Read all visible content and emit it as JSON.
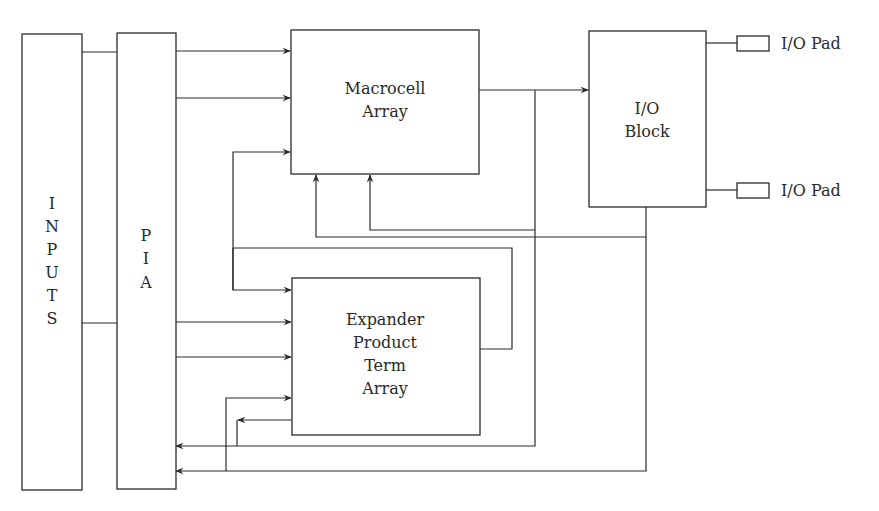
{
  "diagram": {
    "blocks": {
      "inputs": {
        "label_letters": [
          "I",
          "N",
          "P",
          "U",
          "T",
          "S"
        ]
      },
      "pia": {
        "label_letters": [
          "P",
          "I",
          "A"
        ]
      },
      "macrocell": {
        "line1": "Macrocell",
        "line2": "Array"
      },
      "io_block": {
        "line1": "I/O",
        "line2": "Block"
      },
      "expander": {
        "line1": "Expander",
        "line2": "Product",
        "line3": "Term",
        "line4": "Array"
      }
    },
    "pads": [
      {
        "label": "I/O Pad"
      },
      {
        "label": "I/O Pad"
      }
    ],
    "colors": {
      "stroke": "#2a2a2a",
      "background": "#ffffff"
    }
  }
}
